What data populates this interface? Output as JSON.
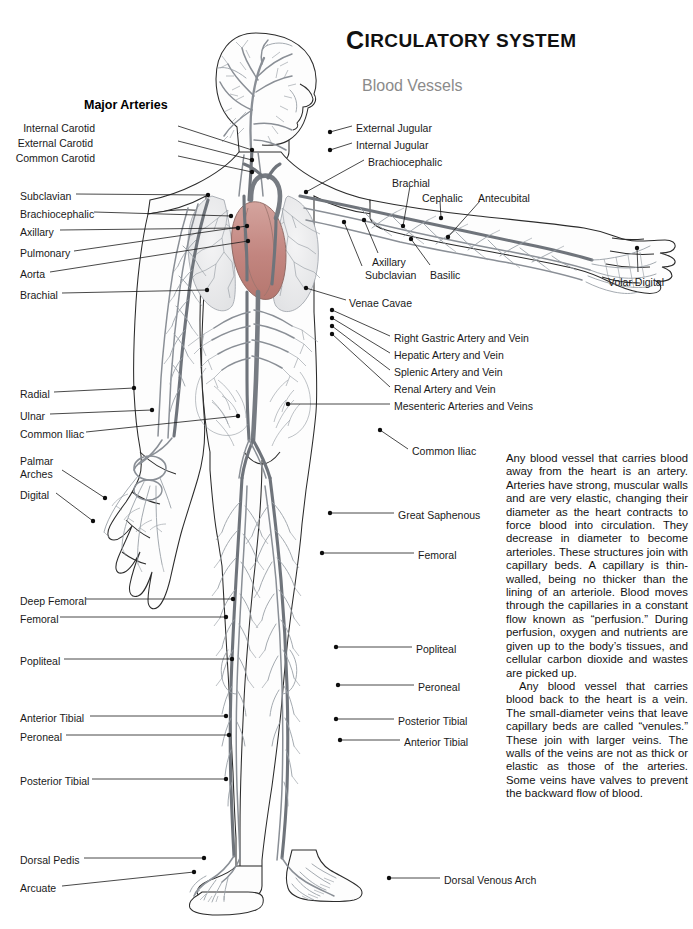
{
  "page": {
    "title": "Circulatory System",
    "title_drop_cap": "C",
    "title_rest": "IRCULATORY SYSTEM",
    "subtitle": "Blood Vessels",
    "section_heading": "Major Arteries",
    "width": 693,
    "height": 929,
    "background_color": "#ffffff",
    "ink_color": "#1a1a1a",
    "subtitle_color": "#8b8b8b",
    "vessel_gray": "#7a7f86",
    "heart_color": "#c98f8b"
  },
  "labels_left": [
    {
      "text": "Internal Carotid",
      "x": 95,
      "y": 122,
      "align": "right",
      "anchor_x": 178,
      "anchor_y": 126,
      "tip_x": 252,
      "tip_y": 150
    },
    {
      "text": "External Carotid",
      "x": 93,
      "y": 137,
      "align": "right",
      "anchor_x": 178,
      "anchor_y": 141,
      "tip_x": 252,
      "tip_y": 160
    },
    {
      "text": "Common Carotid",
      "x": 95,
      "y": 152,
      "align": "right",
      "anchor_x": 178,
      "anchor_y": 156,
      "tip_x": 252,
      "tip_y": 172
    },
    {
      "text": "Subclavian",
      "x": 20,
      "y": 190,
      "align": "left",
      "anchor_x": 76,
      "anchor_y": 194,
      "tip_x": 208,
      "tip_y": 195
    },
    {
      "text": "Brachiocephalic",
      "x": 20,
      "y": 208,
      "align": "left",
      "anchor_x": 94,
      "anchor_y": 212,
      "tip_x": 231,
      "tip_y": 216
    },
    {
      "text": "Axillary",
      "x": 20,
      "y": 226,
      "align": "left",
      "anchor_x": 60,
      "anchor_y": 230,
      "tip_x": 238,
      "tip_y": 228
    },
    {
      "text": "Pulmonary",
      "x": 20,
      "y": 247,
      "align": "left",
      "anchor_x": 74,
      "anchor_y": 251,
      "tip_x": 247,
      "tip_y": 226
    },
    {
      "text": "Aorta",
      "x": 20,
      "y": 268,
      "align": "left",
      "anchor_x": 50,
      "anchor_y": 272,
      "tip_x": 248,
      "tip_y": 241
    },
    {
      "text": "Brachial",
      "x": 20,
      "y": 289,
      "align": "left",
      "anchor_x": 62,
      "anchor_y": 293,
      "tip_x": 207,
      "tip_y": 290
    },
    {
      "text": "Radial",
      "x": 20,
      "y": 388,
      "align": "left",
      "anchor_x": 54,
      "anchor_y": 392,
      "tip_x": 134,
      "tip_y": 388
    },
    {
      "text": "Ulnar",
      "x": 20,
      "y": 410,
      "align": "left",
      "anchor_x": 50,
      "anchor_y": 414,
      "tip_x": 152,
      "tip_y": 410
    },
    {
      "text": "Common Iliac",
      "x": 20,
      "y": 428,
      "align": "left",
      "anchor_x": 86,
      "anchor_y": 432,
      "tip_x": 238,
      "tip_y": 416
    },
    {
      "text": "Palmar",
      "x": 20,
      "y": 455,
      "align": "left",
      "anchor_x": 62,
      "anchor_y": 470,
      "tip_x": 105,
      "tip_y": 498
    },
    {
      "text": "Arches",
      "x": 20,
      "y": 468,
      "align": "left",
      "anchor_x": 0,
      "anchor_y": 0,
      "tip_x": 0,
      "tip_y": 0
    },
    {
      "text": "Digital",
      "x": 20,
      "y": 489,
      "align": "left",
      "anchor_x": 56,
      "anchor_y": 493,
      "tip_x": 93,
      "tip_y": 521
    },
    {
      "text": "Deep Femoral",
      "x": 20,
      "y": 595,
      "align": "left",
      "anchor_x": 86,
      "anchor_y": 599,
      "tip_x": 233,
      "tip_y": 599
    },
    {
      "text": "Femoral",
      "x": 20,
      "y": 613,
      "align": "left",
      "anchor_x": 60,
      "anchor_y": 617,
      "tip_x": 226,
      "tip_y": 617
    },
    {
      "text": "Popliteal",
      "x": 20,
      "y": 655,
      "align": "left",
      "anchor_x": 64,
      "anchor_y": 659,
      "tip_x": 232,
      "tip_y": 659
    },
    {
      "text": "Anterior Tibial",
      "x": 20,
      "y": 712,
      "align": "left",
      "anchor_x": 90,
      "anchor_y": 716,
      "tip_x": 226,
      "tip_y": 716
    },
    {
      "text": "Peroneal",
      "x": 20,
      "y": 731,
      "align": "left",
      "anchor_x": 66,
      "anchor_y": 735,
      "tip_x": 229,
      "tip_y": 735
    },
    {
      "text": "Posterior Tibial",
      "x": 20,
      "y": 775,
      "align": "left",
      "anchor_x": 92,
      "anchor_y": 779,
      "tip_x": 226,
      "tip_y": 779
    },
    {
      "text": "Dorsal Pedis",
      "x": 20,
      "y": 854,
      "align": "left",
      "anchor_x": 84,
      "anchor_y": 858,
      "tip_x": 204,
      "tip_y": 858
    },
    {
      "text": "Arcuate",
      "x": 20,
      "y": 882,
      "align": "left",
      "anchor_x": 62,
      "anchor_y": 886,
      "tip_x": 194,
      "tip_y": 872
    }
  ],
  "labels_right": [
    {
      "text": "External Jugular",
      "x": 356,
      "y": 122,
      "anchor_x": 352,
      "anchor_y": 126,
      "tip_x": 330,
      "tip_y": 132
    },
    {
      "text": "Internal Jugular",
      "x": 356,
      "y": 139,
      "anchor_x": 352,
      "anchor_y": 143,
      "tip_x": 330,
      "tip_y": 150
    },
    {
      "text": "Brachiocephalic",
      "x": 368,
      "y": 156,
      "anchor_x": 364,
      "anchor_y": 160,
      "tip_x": 306,
      "tip_y": 192
    },
    {
      "text": "Brachial",
      "x": 392,
      "y": 177,
      "anchor_x": 410,
      "anchor_y": 186,
      "tip_x": 403,
      "tip_y": 226
    },
    {
      "text": "Cephalic",
      "x": 422,
      "y": 192,
      "anchor_x": 440,
      "anchor_y": 201,
      "tip_x": 441,
      "tip_y": 218
    },
    {
      "text": "Antecubital",
      "x": 478,
      "y": 192,
      "anchor_x": 480,
      "anchor_y": 201,
      "tip_x": 448,
      "tip_y": 237
    },
    {
      "text": "Axillary",
      "x": 372,
      "y": 256,
      "anchor_x": 378,
      "anchor_y": 253,
      "tip_x": 364,
      "tip_y": 220
    },
    {
      "text": "Basilic",
      "x": 430,
      "y": 269,
      "anchor_x": 430,
      "anchor_y": 265,
      "tip_x": 411,
      "tip_y": 239
    },
    {
      "text": "Subclavian",
      "x": 365,
      "y": 269,
      "anchor_x": 362,
      "anchor_y": 266,
      "tip_x": 344,
      "tip_y": 222
    },
    {
      "text": "Venae Cavae",
      "x": 349,
      "y": 297,
      "anchor_x": 346,
      "anchor_y": 300,
      "tip_x": 306,
      "tip_y": 288
    },
    {
      "text": "Right Gastric Artery and Vein",
      "x": 394,
      "y": 332,
      "anchor_x": 390,
      "anchor_y": 336,
      "tip_x": 332,
      "tip_y": 310
    },
    {
      "text": "Hepatic Artery and Vein",
      "x": 394,
      "y": 349,
      "anchor_x": 390,
      "anchor_y": 353,
      "tip_x": 332,
      "tip_y": 318
    },
    {
      "text": "Splenic Artery and Vein",
      "x": 394,
      "y": 366,
      "anchor_x": 390,
      "anchor_y": 370,
      "tip_x": 332,
      "tip_y": 326
    },
    {
      "text": "Renal Artery and Vein",
      "x": 394,
      "y": 383,
      "anchor_x": 390,
      "anchor_y": 387,
      "tip_x": 332,
      "tip_y": 334
    },
    {
      "text": "Mesenteric Arteries and Veins",
      "x": 394,
      "y": 400,
      "anchor_x": 390,
      "anchor_y": 404,
      "tip_x": 288,
      "tip_y": 404
    },
    {
      "text": "Common Iliac",
      "x": 412,
      "y": 445,
      "anchor_x": 408,
      "anchor_y": 449,
      "tip_x": 380,
      "tip_y": 430
    },
    {
      "text": "Great Saphenous",
      "x": 398,
      "y": 509,
      "anchor_x": 394,
      "anchor_y": 513,
      "tip_x": 330,
      "tip_y": 513
    },
    {
      "text": "Femoral",
      "x": 418,
      "y": 549,
      "anchor_x": 414,
      "anchor_y": 553,
      "tip_x": 322,
      "tip_y": 553
    },
    {
      "text": "Popliteal",
      "x": 416,
      "y": 643,
      "anchor_x": 412,
      "anchor_y": 647,
      "tip_x": 336,
      "tip_y": 647
    },
    {
      "text": "Peroneal",
      "x": 418,
      "y": 681,
      "anchor_x": 414,
      "anchor_y": 685,
      "tip_x": 338,
      "tip_y": 685
    },
    {
      "text": "Posterior Tibial",
      "x": 398,
      "y": 715,
      "anchor_x": 394,
      "anchor_y": 719,
      "tip_x": 336,
      "tip_y": 719
    },
    {
      "text": "Anterior Tibial",
      "x": 404,
      "y": 736,
      "anchor_x": 400,
      "anchor_y": 740,
      "tip_x": 340,
      "tip_y": 740
    },
    {
      "text": "Dorsal Venous Arch",
      "x": 444,
      "y": 874,
      "anchor_x": 440,
      "anchor_y": 878,
      "tip_x": 389,
      "tip_y": 878
    },
    {
      "text": "Volar Digital",
      "x": 608,
      "y": 276,
      "anchor_x": 638,
      "anchor_y": 272,
      "tip_x": 637,
      "tip_y": 248
    }
  ],
  "body_text": {
    "paragraph_1": "Any blood vessel that carries blood away from the heart is an artery. Arteries have strong, muscular walls and are very elastic, changing their diameter as the heart contracts to force blood into circulation. They decrease in diameter to become arterioles. These structures join with capillary beds. A capillary is thin-walled, being no thicker than the lining of an arteriole. Blood moves through the capillaries in a constant flow known as “perfusion.” During perfusion, oxygen and nutrients are given up to the body’s tissues, and cellular carbon dioxide and wastes are picked up.",
    "paragraph_2": "Any blood vessel that carries blood back to the heart is a vein. The small-diameter veins that leave capillary beds are called “venules.” These join with larger veins. The walls of the veins are not as thick or elastic as those of the arteries. Some veins have valves to prevent the backward flow of blood."
  },
  "figure": {
    "parts": [
      "head",
      "neck",
      "torso",
      "heart",
      "lungs",
      "abdomen",
      "left-arm",
      "right-arm",
      "left-hand",
      "right-hand",
      "left-leg",
      "right-leg",
      "left-foot",
      "right-foot"
    ]
  }
}
